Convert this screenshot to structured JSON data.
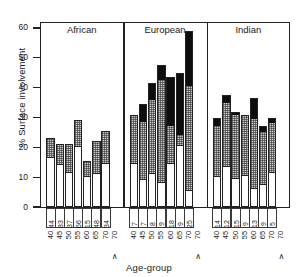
{
  "chart_data": {
    "type": "bar",
    "title": "",
    "xlabel": "Age-group",
    "ylabel": "% Surface involvement",
    "ylim": [
      0,
      62
    ],
    "yticks": [
      0,
      10,
      20,
      30,
      40,
      50,
      60
    ],
    "ytick_labels": [
      "0",
      "10",
      "20",
      "30",
      "40",
      "50",
      "60"
    ],
    "grid": false,
    "legend": "none",
    "stacked": true,
    "segment_names": [
      "white",
      "stippled",
      "black"
    ],
    "categories": [
      "40",
      "45",
      "50",
      "55",
      "60",
      "65",
      "70",
      ">70"
    ],
    "groups": [
      {
        "name": "African",
        "bars": [
          {
            "age": "40",
            "n": "44",
            "white": 16.5,
            "stippled": 6.5,
            "black": 0.0,
            "total": 23.0
          },
          {
            "age": "45",
            "n": "83",
            "white": 14.0,
            "stippled": 7.0,
            "black": 0.0,
            "total": 21.0
          },
          {
            "age": "50",
            "n": "37",
            "white": 11.5,
            "stippled": 9.5,
            "black": 0.0,
            "total": 21.0
          },
          {
            "age": "55",
            "n": "66",
            "white": 20.0,
            "stippled": 9.0,
            "black": 0.0,
            "total": 29.0
          },
          {
            "age": "60",
            "n": "15",
            "white": 10.0,
            "stippled": 5.5,
            "black": 0.0,
            "total": 15.5
          },
          {
            "age": "65",
            "n": "48",
            "white": 11.0,
            "stippled": 11.0,
            "black": 0.0,
            "total": 22.0
          },
          {
            "age": "70",
            "n": "34",
            "white": 14.5,
            "stippled": 11.0,
            "black": 0.0,
            "total": 25.5
          }
        ],
        "last_is_plus": true
      },
      {
        "name": "European",
        "bars": [
          {
            "age": "40",
            "n": "7",
            "white": 14.5,
            "stippled": 16.5,
            "black": 0.0,
            "total": 31.0
          },
          {
            "age": "45",
            "n": "7",
            "white": 9.0,
            "stippled": 19.5,
            "black": 6.0,
            "total": 34.5
          },
          {
            "age": "50",
            "n": "8",
            "white": 11.0,
            "stippled": 25.0,
            "black": 5.5,
            "total": 41.5
          },
          {
            "age": "55",
            "n": "9",
            "white": 8.0,
            "stippled": 34.5,
            "black": 5.0,
            "total": 47.5
          },
          {
            "age": "60",
            "n": "18",
            "white": 14.5,
            "stippled": 12.5,
            "black": 16.5,
            "total": 43.5
          },
          {
            "age": "65",
            "n": "9",
            "white": 20.5,
            "stippled": 3.5,
            "black": 21.0,
            "total": 45.0
          },
          {
            "age": "70",
            "n": "25",
            "white": 5.5,
            "stippled": 35.0,
            "black": 18.5,
            "total": 59.0
          }
        ],
        "last_is_plus": true
      },
      {
        "name": "Indian",
        "bars": [
          {
            "age": "40",
            "n": "14",
            "white": 10.0,
            "stippled": 17.0,
            "black": 3.0,
            "total": 30.0
          },
          {
            "age": "45",
            "n": "12",
            "white": 13.5,
            "stippled": 21.5,
            "black": 2.5,
            "total": 37.5
          },
          {
            "age": "50",
            "n": "15",
            "white": 9.5,
            "stippled": 21.5,
            "black": 1.0,
            "total": 32.0
          },
          {
            "age": "55",
            "n": "9",
            "white": 10.5,
            "stippled": 20.0,
            "black": 0.5,
            "total": 31.0
          },
          {
            "age": "60",
            "n": "13",
            "white": 6.0,
            "stippled": 23.5,
            "black": 7.0,
            "total": 36.5
          },
          {
            "age": "65",
            "n": "9",
            "white": 7.5,
            "stippled": 17.5,
            "black": 2.0,
            "total": 27.0
          },
          {
            "age": "70",
            "n": "5",
            "white": 11.5,
            "stippled": 16.5,
            "black": 2.0,
            "total": 30.0
          }
        ],
        "last_is_plus": true
      }
    ],
    "plus_marker": "∧",
    "colors": {
      "white_segment": "#ffffff",
      "stippled_segment": "#c9c9c9",
      "black_segment": "#0d0d0d",
      "axis": "#222222",
      "text": "#1a1a1a"
    }
  }
}
